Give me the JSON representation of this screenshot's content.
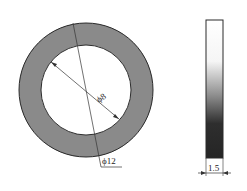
{
  "diagram": {
    "front_view": {
      "outer_diameter_label": "ϕ12",
      "inner_diameter_label": "ϕ8",
      "ring_color": "#8a8a8a",
      "outline_color": "#2a2a2a"
    },
    "side_view": {
      "thickness_label": "1.5",
      "gradient_colors": [
        "#ffffff",
        "#f0f0f0",
        "#909090",
        "#303030",
        "#222222"
      ]
    }
  }
}
